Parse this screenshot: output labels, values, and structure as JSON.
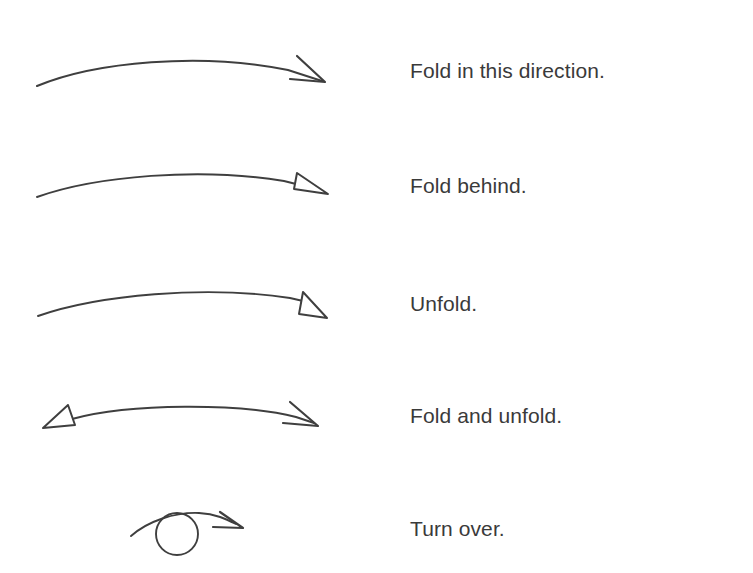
{
  "document": {
    "title": "Origami symbols legend",
    "background_color": "#ffffff",
    "ink_color": "#3f3f3f",
    "text_color": "#3a3a3a"
  },
  "legend": {
    "rows": [
      {
        "id": "fold-in-this-direction",
        "label": "Fold in this direction.",
        "symbol": "curved-arrow-solid-open-head",
        "arrowhead": "open-v",
        "direction": "right",
        "label_x": 410,
        "label_y": 72
      },
      {
        "id": "fold-behind",
        "label": "Fold behind.",
        "symbol": "curved-arrow-narrow-hollow-head",
        "arrowhead": "hollow-narrow-triangle",
        "direction": "right",
        "label_x": 410,
        "label_y": 187
      },
      {
        "id": "unfold",
        "label": "Unfold.",
        "symbol": "curved-arrow-wide-hollow-head",
        "arrowhead": "hollow-wide-triangle",
        "direction": "right",
        "label_x": 410,
        "label_y": 305
      },
      {
        "id": "fold-and-unfold",
        "label": "Fold and unfold.",
        "symbol": "curved-double-arrow",
        "arrowhead": "hollow-triangle-left-and-open-v-right",
        "direction": "both",
        "label_x": 410,
        "label_y": 417
      },
      {
        "id": "turn-over",
        "label": "Turn over.",
        "symbol": "turn-over-loop-arrow",
        "arrowhead": "open-v",
        "direction": "right",
        "label_x": 410,
        "label_y": 530
      }
    ]
  }
}
